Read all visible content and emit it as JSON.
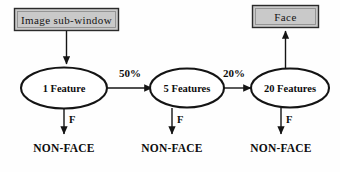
{
  "diagram": {
    "colors": {
      "box_fill": "#c9c9c9",
      "box_stroke": "#2b2b2b",
      "ellipse_fill": "#ffffff",
      "ellipse_stroke": "#141414",
      "line": "#141414",
      "text": "#0d0d0d",
      "background": "#fefefe"
    },
    "input_box": {
      "label": "Image sub-window"
    },
    "output_box": {
      "label": "Face"
    },
    "stages": [
      {
        "label": "1 Feature",
        "reject_label": "NON-FACE",
        "fail_label": "F",
        "pass_rate": ""
      },
      {
        "label": "5 Features",
        "reject_label": "NON-FACE",
        "fail_label": "F",
        "pass_rate": "50%"
      },
      {
        "label": "20 Features",
        "reject_label": "NON-FACE",
        "fail_label": "F",
        "pass_rate": "20%"
      }
    ],
    "transitions": [
      {
        "label": "50%",
        "from": "1 Feature",
        "to": "5 Features"
      },
      {
        "label": "20%",
        "from": "5 Features",
        "to": "20 Features"
      }
    ]
  }
}
